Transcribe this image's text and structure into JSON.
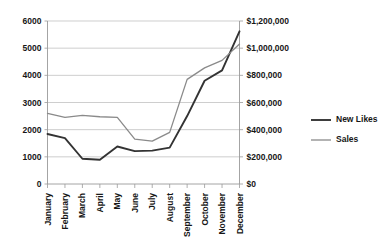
{
  "chart_data": {
    "type": "line",
    "title": "",
    "xlabel": "",
    "ylabel": "",
    "grid": true,
    "legend_position": "right",
    "categories": [
      "January",
      "February",
      "March",
      "April",
      "May",
      "June",
      "July",
      "August",
      "September",
      "October",
      "November",
      "December"
    ],
    "axes": {
      "left": {
        "label": "",
        "min": 0,
        "max": 6000,
        "step": 1000,
        "ticks": [
          "0",
          "1000",
          "2000",
          "3000",
          "4000",
          "5000",
          "6000"
        ]
      },
      "right": {
        "label": "",
        "min": 0,
        "max": 1200000,
        "step": 200000,
        "ticks": [
          "$0",
          "$200,000",
          "$400,000",
          "$600,000",
          "$800,000",
          "$1,000,000",
          "$1,200,000"
        ]
      }
    },
    "series": [
      {
        "name": "New Likes",
        "axis": "left",
        "color": "#333333",
        "values": [
          1840,
          1690,
          930,
          890,
          1380,
          1210,
          1230,
          1340,
          2500,
          3800,
          4180,
          5620
        ]
      },
      {
        "name": "Sales",
        "axis": "right",
        "color": "#8a8a8a",
        "values": [
          520000,
          490000,
          505000,
          495000,
          490000,
          330000,
          316000,
          380000,
          770000,
          855000,
          910000,
          1030000
        ]
      }
    ]
  },
  "legend": {
    "items": [
      {
        "label": "New Likes",
        "color": "#333333"
      },
      {
        "label": "Sales",
        "color": "#8a8a8a"
      }
    ]
  }
}
